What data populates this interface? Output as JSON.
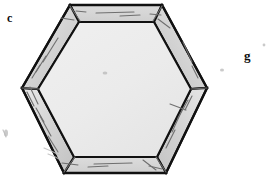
{
  "figure": {
    "background_color": "#ffffff",
    "width": 276,
    "height": 179,
    "labels": [
      {
        "id": "c",
        "text": "c",
        "x": 7,
        "y": 12,
        "role": "panel-label"
      },
      {
        "id": "g",
        "text": "g",
        "x": 244,
        "y": 49,
        "role": "panel-label"
      }
    ],
    "shape": {
      "name": "hexagon-bezel",
      "type": "regular-hexagon-flat-left-right",
      "outline_color": "#111111",
      "outline_width": 2.2,
      "band_fill": "#d2d2d2",
      "band_fill_light": "#e4e4e4",
      "face_fill": "#ededed",
      "face_fill_edge": "#e2e2e2",
      "outer_vertices": [
        {
          "x": 70,
          "y": 5
        },
        {
          "x": 162,
          "y": 5
        },
        {
          "x": 207,
          "y": 88
        },
        {
          "x": 166,
          "y": 173
        },
        {
          "x": 64,
          "y": 173
        },
        {
          "x": 22,
          "y": 88
        }
      ],
      "inner_vertices": [
        {
          "x": 79,
          "y": 22
        },
        {
          "x": 154,
          "y": 22
        },
        {
          "x": 191,
          "y": 89
        },
        {
          "x": 157,
          "y": 157
        },
        {
          "x": 74,
          "y": 157
        },
        {
          "x": 38,
          "y": 89
        }
      ],
      "band_width_px": 16,
      "scratch_marks": 14,
      "scratch_color": "#6a6a6a"
    },
    "specks": [
      {
        "x": 5,
        "y": 132,
        "w": 5,
        "h": 7
      },
      {
        "x": 222,
        "y": 70,
        "w": 4,
        "h": 4
      },
      {
        "x": 263,
        "y": 45,
        "w": 3,
        "h": 3
      },
      {
        "x": 46,
        "y": 150,
        "w": 12,
        "h": 6
      },
      {
        "x": 104,
        "y": 72,
        "w": 5,
        "h": 4
      }
    ]
  }
}
